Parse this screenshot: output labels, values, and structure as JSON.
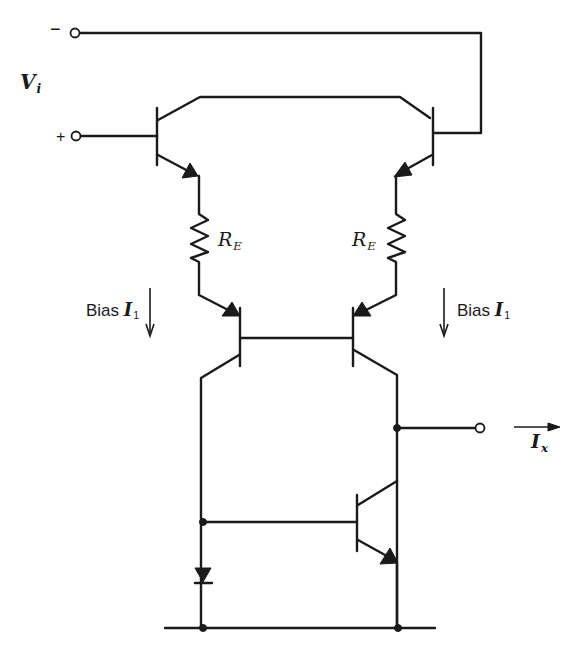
{
  "diagram": {
    "labels": {
      "vi": {
        "main": "V",
        "sub": "i"
      },
      "minus_terminal": "−",
      "plus_terminal": "+",
      "re_left": {
        "main": "R",
        "sub": "E"
      },
      "re_right": {
        "main": "R",
        "sub": "E"
      },
      "bias_left": {
        "text": "Bias ",
        "main": "I",
        "sub": "1"
      },
      "bias_right": {
        "text": "Bias ",
        "main": "I",
        "sub": "1"
      },
      "ix": {
        "main": "I",
        "sub": "x"
      }
    },
    "components": [
      {
        "id": "Q1",
        "type": "npn-transistor",
        "role": "input (+)"
      },
      {
        "id": "Q2",
        "type": "npn-transistor",
        "role": "input (−)"
      },
      {
        "id": "RE1",
        "type": "resistor",
        "label": "R_E"
      },
      {
        "id": "RE2",
        "type": "resistor",
        "label": "R_E"
      },
      {
        "id": "Q3",
        "type": "pnp-transistor",
        "role": "current mirror left"
      },
      {
        "id": "Q4",
        "type": "pnp-transistor",
        "role": "current mirror right"
      },
      {
        "id": "Q5",
        "type": "npn-transistor",
        "role": "output mirror"
      },
      {
        "id": "D1",
        "type": "diode",
        "role": "mirror reference"
      }
    ],
    "colors": {
      "ink": "#1a1a1a",
      "background": "#ffffff"
    }
  }
}
